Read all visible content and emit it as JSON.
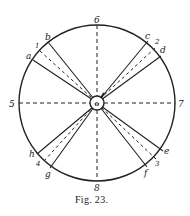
{
  "figure": {
    "caption": "Fig. 23.",
    "center_label": "o"
  },
  "axes_labels": {
    "top": "6",
    "bottom": "8",
    "left": "5",
    "right": "7"
  },
  "sectors": [
    {
      "name": "upper-left",
      "edge1": "a",
      "mid": "1",
      "edge2": "b"
    },
    {
      "name": "upper-right",
      "edge1": "c",
      "mid": "2",
      "edge2": "d"
    },
    {
      "name": "lower-left",
      "edge1": "h",
      "mid": "4",
      "edge2": "g"
    },
    {
      "name": "lower-right",
      "edge1": "e",
      "mid": "3",
      "edge2": "f"
    }
  ],
  "colors": {
    "stroke": "#222222",
    "background": "#ffffff"
  }
}
